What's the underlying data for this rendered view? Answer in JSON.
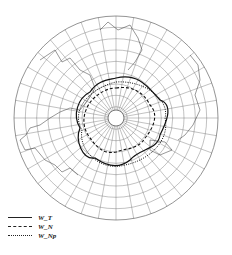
{
  "map": {
    "projection": "north-polar-stereographic",
    "center": {
      "x": 116,
      "y": 118
    },
    "radius": 102,
    "latitude_circles": 9,
    "meridian_count": 36,
    "pole_hole_radius": 8
  },
  "legend": {
    "items": [
      {
        "label": "W_T",
        "style": "solid"
      },
      {
        "label": "W_N",
        "style": "dashed"
      },
      {
        "label": "W_Np",
        "style": "dotted"
      }
    ]
  },
  "colors": {
    "ink": "#222222",
    "grid": "#555555",
    "background": "#ffffff"
  }
}
